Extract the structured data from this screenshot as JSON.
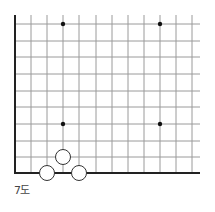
{
  "diagram": {
    "type": "go-board-corner",
    "caption": "7도",
    "grid": {
      "x_lines": [
        15,
        31,
        47,
        63,
        79,
        96,
        112,
        128,
        144,
        160,
        176,
        192
      ],
      "y_lines": [
        24,
        41,
        57,
        74,
        91,
        107,
        124,
        141,
        157,
        173
      ],
      "x_extent": [
        15,
        200
      ],
      "y_extent": [
        15,
        173
      ],
      "edges": [
        "left",
        "bottom"
      ],
      "line_color": "#9a9a9a",
      "edge_color": "#222222"
    },
    "star_points": [
      {
        "x": 63,
        "y": 24
      },
      {
        "x": 160,
        "y": 24
      },
      {
        "x": 63,
        "y": 124
      },
      {
        "x": 160,
        "y": 124
      }
    ],
    "stones": [
      {
        "color": "white",
        "x": 47,
        "y": 173
      },
      {
        "color": "white",
        "x": 63,
        "y": 157
      },
      {
        "color": "white",
        "x": 79,
        "y": 173
      }
    ],
    "stone_radius": 7.5
  }
}
